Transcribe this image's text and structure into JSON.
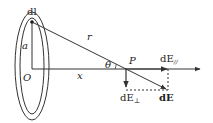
{
  "diagram": {
    "labels": {
      "dl": "dl",
      "a": "a",
      "r": "r",
      "O": "O",
      "x": "x",
      "theta": "θ",
      "P": "P",
      "dE_parallel": "dE",
      "dE_parallel_sub": "//",
      "dE_perp": "dE",
      "dE_perp_sub": "⊥",
      "dE": "dE"
    },
    "colors": {
      "stroke": "#333333",
      "background": "#ffffff"
    }
  }
}
